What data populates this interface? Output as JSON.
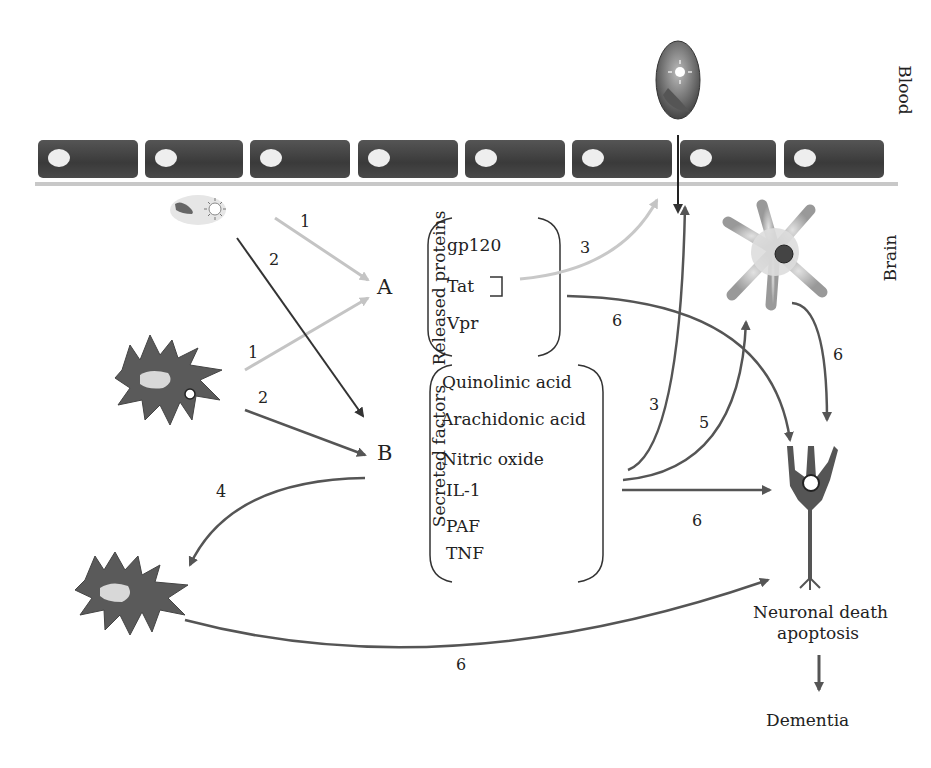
{
  "compartments": {
    "blood": "Blood",
    "brain": "Brain"
  },
  "groups": {
    "A": {
      "letter": "A",
      "title": "Released proteins",
      "items": [
        "gp120",
        "Tat",
        "Vpr"
      ]
    },
    "B": {
      "letter": "B",
      "title": "Secreted factors",
      "items": [
        "Quinolinic acid",
        "Arachidonic acid",
        "Nitric oxide",
        "IL-1",
        "PAF",
        "TNF"
      ]
    }
  },
  "arrow_labels": {
    "a1_top": "1",
    "a2_top": "2",
    "a1_mid": "1",
    "a2_mid": "2",
    "a3_gray": "3",
    "a6_A": "6",
    "a3_B": "3",
    "a5_B": "5",
    "a6_astro": "6",
    "a4": "4",
    "a6_B": "6",
    "a6_bottom": "6"
  },
  "outcomes": {
    "neuronal_death_line1": "Neuronal death",
    "neuronal_death_line2": "apoptosis",
    "dementia": "Dementia"
  },
  "colors": {
    "endothelium": "#444444",
    "arrow_dark": "#555555",
    "arrow_light": "#c8c8c8",
    "cell": "#5a5a5a"
  }
}
